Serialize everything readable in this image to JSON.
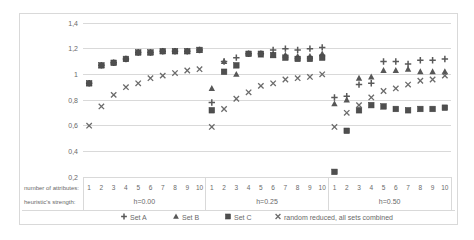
{
  "chart_data": {
    "type": "scatter",
    "title": "",
    "y_axis": {
      "min": 0.2,
      "max": 1.4,
      "step": 0.2,
      "tick_labels": [
        "1,4",
        "1,2",
        "1",
        "0,8",
        "0,6",
        "0,4",
        "0,2"
      ],
      "tick_values": [
        1.4,
        1.2,
        1.0,
        0.8,
        0.6,
        0.4,
        0.2
      ],
      "grid": true
    },
    "x_axis": {
      "tick_labels": [
        "1",
        "2",
        "3",
        "4",
        "5",
        "6",
        "7",
        "8",
        "9",
        "10"
      ],
      "group_labels": [
        "h=0.00",
        "h=0.25",
        "h=0.50"
      ],
      "row_labels": [
        "number of attributes:",
        "heuristic's strength:"
      ]
    },
    "legend_position": "bottom",
    "series": [
      {
        "name": "Set A",
        "marker": "plus",
        "color": "#595959",
        "values_by_group": [
          [
            0.93,
            1.07,
            1.09,
            1.12,
            1.17,
            1.17,
            1.18,
            1.18,
            1.18,
            1.19
          ],
          [
            0.78,
            1.1,
            1.13,
            1.16,
            1.16,
            1.19,
            1.2,
            1.19,
            1.2,
            1.21
          ],
          [
            0.82,
            0.83,
            0.92,
            0.93,
            1.1,
            1.1,
            1.08,
            1.11,
            1.11,
            1.12
          ]
        ]
      },
      {
        "name": "Set B",
        "marker": "triangle",
        "color": "#575757",
        "values_by_group": [
          [
            0.93,
            1.07,
            1.09,
            1.12,
            1.17,
            1.17,
            1.18,
            1.18,
            1.18,
            1.19
          ],
          [
            0.89,
            1.1,
            1.0,
            1.16,
            1.15,
            1.15,
            1.15,
            1.14,
            1.14,
            1.16
          ],
          [
            0.77,
            0.8,
            0.97,
            0.98,
            1.03,
            1.03,
            1.04,
            1.02,
            1.02,
            1.02
          ]
        ]
      },
      {
        "name": "Set C",
        "marker": "square",
        "color": "#4f4f4f",
        "values_by_group": [
          [
            0.93,
            1.07,
            1.09,
            1.12,
            1.17,
            1.17,
            1.18,
            1.18,
            1.18,
            1.19
          ],
          [
            0.72,
            1.02,
            1.07,
            1.16,
            1.16,
            1.15,
            1.13,
            1.12,
            1.12,
            1.13
          ],
          [
            0.24,
            0.56,
            0.72,
            0.76,
            0.75,
            0.73,
            0.72,
            0.73,
            0.73,
            0.74
          ]
        ]
      },
      {
        "name": "random reduced, all sets combined",
        "marker": "x",
        "color": "#6b6b6b",
        "values_by_group": [
          [
            0.6,
            0.75,
            0.84,
            0.9,
            0.93,
            0.97,
            0.99,
            1.01,
            1.03,
            1.04
          ],
          [
            0.59,
            0.73,
            0.81,
            0.86,
            0.91,
            0.93,
            0.96,
            0.97,
            0.98,
            1.0
          ],
          [
            0.59,
            0.7,
            0.76,
            0.82,
            0.87,
            0.89,
            0.92,
            0.95,
            0.96,
            0.99
          ]
        ]
      }
    ],
    "colors": {
      "grid": "#d9d9d9",
      "axis_table_line": "#d9d9d9",
      "text": "#696969",
      "border": "#d9d9d9",
      "background": "#ffffff"
    }
  }
}
